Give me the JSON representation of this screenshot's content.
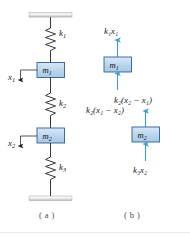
{
  "figure": {
    "colors": {
      "mass_fill": "#bdd7ee",
      "mass_stroke": "#2f5f8f",
      "arrow": "#3b9fd6",
      "line": "#231f20",
      "support": "#c9c9c9",
      "caption": "#4a4a4a"
    }
  },
  "panel_a": {
    "caption": "( a )",
    "springs": [
      {
        "name": "k1",
        "label_k": "k",
        "label_sub": "1"
      },
      {
        "name": "k2",
        "label_k": "k",
        "label_sub": "2"
      },
      {
        "name": "k3",
        "label_k": "k",
        "label_sub": "3"
      }
    ],
    "masses": [
      {
        "name": "m1",
        "label_m": "m",
        "label_sub": "1"
      },
      {
        "name": "m2",
        "label_m": "m",
        "label_sub": "2"
      }
    ],
    "displacements": [
      {
        "name": "x1",
        "label_x": "x",
        "label_sub": "1",
        "direction": "down"
      },
      {
        "name": "x2",
        "label_x": "x",
        "label_sub": "2",
        "direction": "down"
      }
    ]
  },
  "panel_b": {
    "caption": "( b )",
    "bodies": [
      {
        "name": "m1",
        "label_m": "m",
        "label_sub": "1",
        "force_up_top": "k₁x₁",
        "force_up_bottom": "k₂(x₁ − x₂)"
      },
      {
        "name": "m2",
        "label_m": "m",
        "label_sub": "2",
        "force_up_top": "k₂(x₂ − x₁)",
        "force_up_bottom": "k₃x₂"
      }
    ],
    "force_labels": {
      "k1x1": "k₁x₁",
      "k2_x1_minus_x2": "k₂(x₁ − x₂)",
      "k2_x2_minus_x1": "k₂(x₂ − x₁)",
      "k3x2": "k₃x₂"
    }
  }
}
